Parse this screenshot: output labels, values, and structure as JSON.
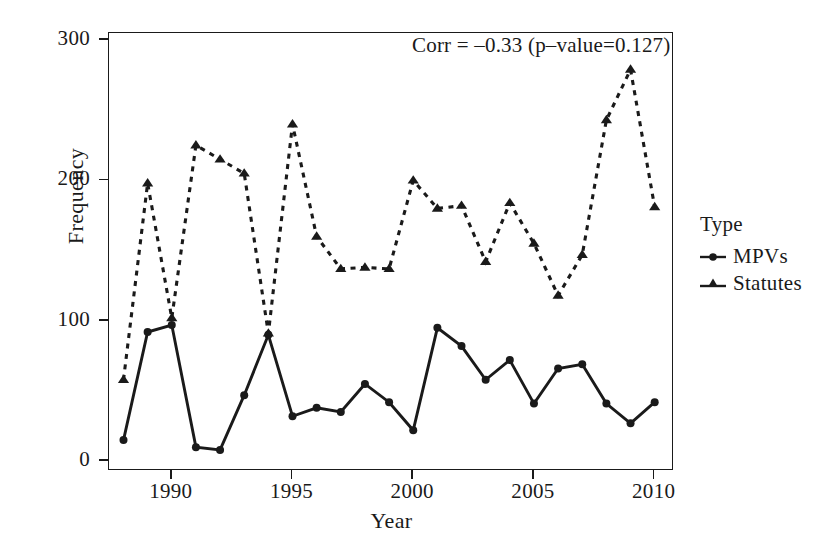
{
  "chart_data": {
    "type": "line",
    "title": "",
    "xlabel": "Year",
    "ylabel": "Frequency",
    "xlim": [
      1987.4,
      2010.8
    ],
    "ylim": [
      -7,
      305
    ],
    "xticks": [
      1990,
      1995,
      2000,
      2005,
      2010
    ],
    "yticks": [
      0,
      100,
      200,
      300
    ],
    "grid": false,
    "legend_position": "right",
    "legend_title": "Type",
    "annotation": "Corr = –0.33 (p–value=0.127)",
    "x": [
      1988,
      1989,
      1990,
      1991,
      1992,
      1993,
      1994,
      1995,
      1996,
      1997,
      1998,
      1999,
      2000,
      2001,
      2002,
      2003,
      2004,
      2005,
      2006,
      2007,
      2008,
      2009,
      2010
    ],
    "series": [
      {
        "name": "MPVs",
        "marker": "circle",
        "linestyle": "solid",
        "color": "#1a1a1a",
        "values": [
          15,
          92,
          97,
          10,
          8,
          47,
          90,
          32,
          38,
          35,
          55,
          42,
          22,
          95,
          82,
          58,
          72,
          41,
          66,
          69,
          41,
          27,
          42
        ]
      },
      {
        "name": "Statutes",
        "marker": "triangle",
        "linestyle": "dashed",
        "color": "#1a1a1a",
        "values": [
          58,
          198,
          102,
          225,
          215,
          205,
          91,
          240,
          160,
          137,
          138,
          137,
          200,
          180,
          182,
          142,
          184,
          155,
          118,
          147,
          243,
          279,
          181
        ]
      }
    ]
  },
  "axes": {
    "ytick_labels": [
      "0",
      "100",
      "200",
      "300"
    ],
    "xtick_labels": [
      "1990",
      "1995",
      "2000",
      "2005",
      "2010"
    ],
    "ylabel_text": "Frequency",
    "xlabel_text": "Year"
  },
  "annotation": {
    "corr_text": "Corr = –0.33 (p–value=0.127)"
  },
  "legend": {
    "title": "Type",
    "entries": [
      {
        "label": "MPVs",
        "marker": "circle-marker"
      },
      {
        "label": "Statutes",
        "marker": "triangle-marker"
      }
    ]
  },
  "style": {
    "foreground": "#1a1a1a",
    "background": "#ffffff"
  }
}
